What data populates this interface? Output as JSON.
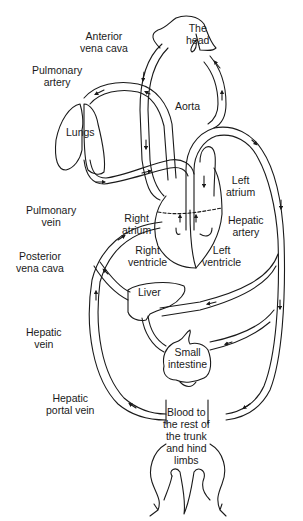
{
  "diagram": {
    "type": "circulatory-system",
    "colors": {
      "line": "#1a1a1a",
      "background": "#ffffff"
    },
    "labels": {
      "the_head": "The head",
      "the_head_l1": "The",
      "the_head_l2": "head",
      "anterior_vena_cava_l1": "Anterior",
      "anterior_vena_cava_l2": "vena cava",
      "pulmonary_artery_l1": "Pulmonary",
      "pulmonary_artery_l2": "artery",
      "lungs": "Lungs",
      "aorta": "Aorta",
      "left_atrium_l1": "Left",
      "left_atrium_l2": "atrium",
      "pulmonary_vein_l1": "Pulmonary",
      "pulmonary_vein_l2": "vein",
      "right_atrium_l1": "Right",
      "right_atrium_l2": "atrium",
      "hepatic_artery_l1": "Hepatic",
      "hepatic_artery_l2": "artery",
      "posterior_vena_cava_l1": "Posterior",
      "posterior_vena_cava_l2": "vena cava",
      "right_ventricle_l1": "Right",
      "right_ventricle_l2": "ventricle",
      "left_ventricle_l1": "Left",
      "left_ventricle_l2": "ventricle",
      "liver": "Liver",
      "hepatic_vein_l1": "Hepatic",
      "hepatic_vein_l2": "vein",
      "small_intestine_l1": "Small",
      "small_intestine_l2": "intestine",
      "hepatic_portal_vein_l1": "Hepatic",
      "hepatic_portal_vein_l2": "portal vein",
      "blood_rest_l1": "Blood to",
      "blood_rest_l2": "the rest of",
      "blood_rest_l3": "the trunk",
      "blood_rest_l4": "and hind",
      "blood_rest_l5": "limbs"
    }
  }
}
